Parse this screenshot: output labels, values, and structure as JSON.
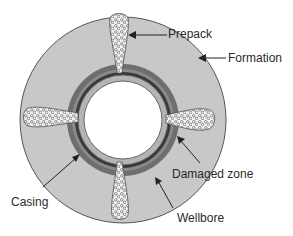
{
  "diagram": {
    "type": "cross-section",
    "colors": {
      "formation": "#c8c8c8",
      "formation_outline": "#555555",
      "wellbore_ring": "#6e6e6e",
      "damaged_zone": "#8a8a8a",
      "casing": "#b4b4b4",
      "inner_bore": "#ffffff",
      "prepack_fill": "#f4f4f4",
      "line": "#222222"
    },
    "labels": [
      {
        "id": "prepack",
        "text": "Prepack"
      },
      {
        "id": "formation",
        "text": "Formation"
      },
      {
        "id": "damaged-zone",
        "text": "Damaged zone"
      },
      {
        "id": "casing",
        "text": "Casing"
      },
      {
        "id": "wellbore",
        "text": "Wellbore"
      }
    ],
    "perforations": [
      "top",
      "right",
      "bottom",
      "left"
    ]
  }
}
